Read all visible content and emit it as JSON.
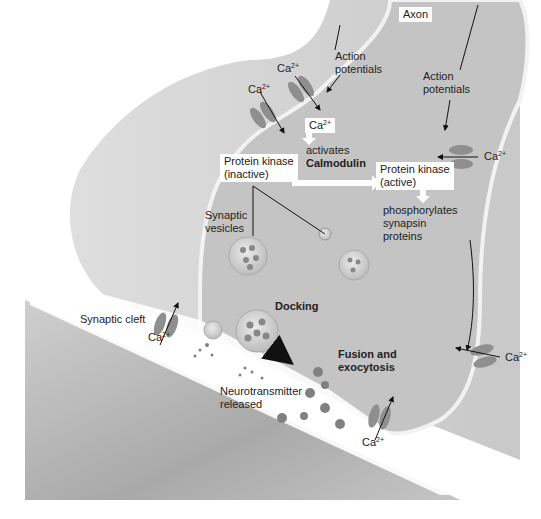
{
  "diagram": {
    "type": "synaptic-terminal-illustration",
    "labels": {
      "axon": "Axon",
      "action_potentials_1": "Action potentials",
      "action_potentials_2": "Action potentials",
      "ca_symbol": "Ca",
      "ca_charge": "2+",
      "activates": "activates",
      "calmodulin": "Calmodulin",
      "pk_inactive_line1": "Protein kinase",
      "pk_inactive_line2": "(inactive)",
      "pk_active_line1": "Protein kinase",
      "pk_active_line2": "(active)",
      "phosphorylates_line1": "phosphorylates",
      "phosphorylates_line2": "synapsin",
      "phosphorylates_line3": "proteins",
      "synaptic_vesicles_line1": "Synaptic",
      "synaptic_vesicles_line2": "vesicles",
      "synaptic_cleft": "Synaptic cleft",
      "docking": "Docking",
      "fusion_line1": "Fusion and",
      "fusion_line2": "exocytosis",
      "neurotransmitter_line1": "Neurotransmitter",
      "neurotransmitter_line2": "released"
    },
    "colors": {
      "terminal_fill": "#c4c4c4",
      "outer_fill": "#d2d2d2",
      "membrane": "#f2f2f2",
      "postsynaptic": "#bdbdbd",
      "channel": "#8f8f8f",
      "vesicle": "#d8d8d8",
      "neurotransmitter": "#808080"
    }
  }
}
